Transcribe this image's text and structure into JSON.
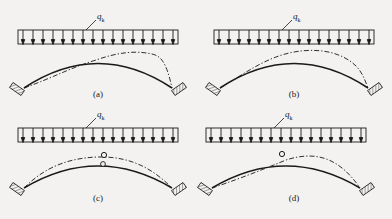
{
  "figure": {
    "background_color": "#f3f2f0",
    "ink_color": "#1a1a1a",
    "panel_count": 4
  },
  "load": {
    "symbol": "q",
    "subscript": "k",
    "label": "qk",
    "type": "uniformly distributed load",
    "arrow_count": 16,
    "direction": "downward"
  },
  "panels": [
    {
      "id": "a",
      "caption": "(a)",
      "support_type": "fixed inclined hatched support",
      "hinge_count": 0,
      "hinges": [],
      "solid_curve": "parabolic arch axis",
      "dashed_curve": "deflected shape dipping left, crossing right of crown, bulging right",
      "dashed_style": "dash-dot"
    },
    {
      "id": "b",
      "caption": "(b)",
      "support_type": "fixed inclined hatched support",
      "hinge_count": 0,
      "hinges": [],
      "solid_curve": "parabolic arch axis",
      "dashed_curve": "deflected shape closely following arch, slight rise right of crown",
      "dashed_style": "dash-dot"
    },
    {
      "id": "c",
      "caption": "(c)",
      "support_type": "fixed inclined hatched support",
      "hinge_count": 2,
      "hinges": [
        {
          "name": "crown-hinge-solid",
          "on": "solid arch crown"
        },
        {
          "name": "crown-hinge-dashed",
          "on": "dashed curve below crown"
        }
      ],
      "solid_curve": "parabolic arch axis with crown hinge",
      "dashed_curve": "deflected shape rising above arch on both haunches",
      "dashed_style": "dash-dot"
    },
    {
      "id": "d",
      "caption": "(d)",
      "support_type": "fixed inclined hatched support",
      "hinge_count": 1,
      "hinges": [
        {
          "name": "crown-hinge",
          "on": "solid arch crown, slightly left of mid-span"
        }
      ],
      "solid_curve": "parabolic arch axis with crown hinge",
      "dashed_curve": "deflected shape below arch on left, above arch on right",
      "dashed_style": "dash-dot"
    }
  ]
}
